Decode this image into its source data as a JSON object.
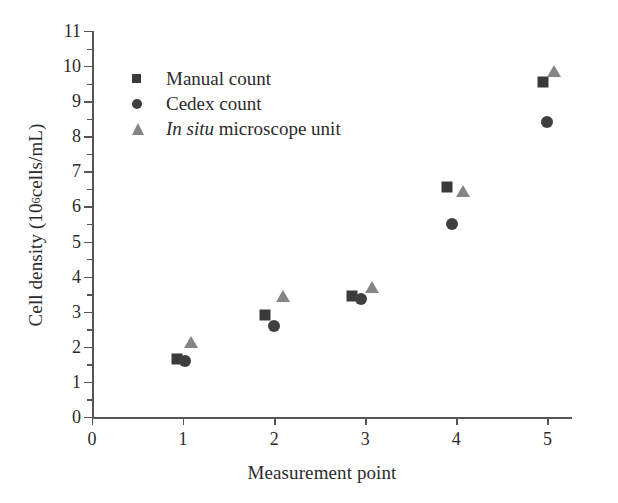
{
  "chart_data": {
    "type": "scatter",
    "title": "",
    "xlabel": "Measurement point",
    "ylabel": "Cell density (10⁶ cells/mL)",
    "ylabel_main": "Cell density (10",
    "ylabel_sup": "6",
    "ylabel_tail": " cells/mL)",
    "xlim": [
      0,
      5.27
    ],
    "ylim": [
      0,
      11
    ],
    "xticks": [
      0,
      1,
      2,
      3,
      4,
      5
    ],
    "xtick_labels": [
      "0",
      "1",
      "2",
      "3",
      "4",
      "5"
    ],
    "yticks": [
      0,
      1,
      2,
      3,
      4,
      5,
      6,
      7,
      8,
      9,
      10,
      11
    ],
    "ytick_labels": [
      "0",
      "1",
      "2",
      "3",
      "4",
      "5",
      "6",
      "7",
      "8",
      "9",
      "10",
      "11"
    ],
    "y_minor_ticks": [
      0.5,
      1.5,
      2.5,
      3.5,
      4.5,
      5.5,
      6.5,
      7.5,
      8.5,
      9.5,
      10.5
    ],
    "grid": false,
    "legend_position": "upper-left-inside",
    "series": [
      {
        "name": "Manual count",
        "marker": "square",
        "color": "#3a3a3a",
        "x": [
          0.93,
          1.9,
          2.85,
          3.9,
          4.95
        ],
        "y": [
          1.65,
          2.9,
          3.45,
          6.55,
          9.55
        ]
      },
      {
        "name": "Cedex count",
        "marker": "circle",
        "color": "#3f3f3f",
        "x": [
          1.02,
          2.0,
          2.95,
          3.95,
          5.0
        ],
        "y": [
          1.6,
          2.6,
          3.35,
          5.5,
          8.4
        ]
      },
      {
        "name": "In situ microscope unit",
        "marker": "triangle",
        "color": "#858585",
        "label_italic": "In situ",
        "label_rest": " microscope unit",
        "x": [
          1.09,
          2.1,
          3.07,
          4.07,
          5.07
        ],
        "y": [
          2.15,
          3.45,
          3.7,
          6.45,
          9.85
        ]
      }
    ]
  },
  "legend": {
    "items": [
      {
        "label": "Manual count"
      },
      {
        "label": "Cedex count"
      },
      {
        "label": "In situ microscope unit"
      }
    ]
  },
  "colors": {
    "axis": "#555555",
    "text": "#2b2b2b",
    "dark_marker": "#3a3a3a",
    "gray_marker": "#858585",
    "background": "#ffffff"
  }
}
